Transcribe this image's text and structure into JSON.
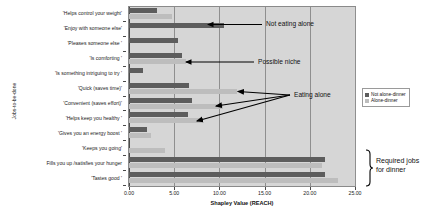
{
  "chart_data": {
    "type": "bar",
    "orientation": "horizontal",
    "title": "",
    "xlabel": "Shapley Value (REACH)",
    "ylabel": "Jobs-to-be-done",
    "xlim": [
      0.0,
      25.0
    ],
    "xticks": [
      "0.00",
      "5.00",
      "10.00",
      "15.00",
      "20.00",
      "25.00"
    ],
    "xtick_values": [
      0,
      5,
      10,
      15,
      20,
      25
    ],
    "grid": true,
    "legend_position": "right",
    "categories": [
      "'Helps control your weight'",
      "'Enjoy with someone else'",
      "'Pleases someone else '",
      "'Is comforting '",
      "'Is something intriguing to try '",
      "'Quick (saves time)'",
      "'Convenient (saves effort)'",
      "'Helps keep you healthy '",
      "'Gives you an energy boost '",
      "'Keeps you going'",
      "Fills you up /satisfies your hunger",
      "'Tastes good '"
    ],
    "series": [
      {
        "name": "Not alone-dinner",
        "color": "#5d5d5d",
        "values": [
          3.1,
          10.5,
          5.4,
          5.9,
          1.5,
          6.6,
          7.0,
          6.5,
          2.0,
          0.0,
          21.7,
          21.7
        ]
      },
      {
        "name": "Alone-dinner",
        "color": "#bdbdbd",
        "values": [
          4.8,
          0.0,
          0.0,
          6.3,
          0.0,
          12.0,
          10.4,
          8.2,
          2.4,
          4.0,
          21.4,
          23.1
        ]
      }
    ],
    "annotations": [
      {
        "text": "Not eating alone",
        "target_category": "'Enjoy with someone else'"
      },
      {
        "text": "Possible niche",
        "target_category": "'Is comforting '"
      },
      {
        "text": "Eating alone",
        "target_category": "'Quick (saves time)'"
      },
      {
        "text": "Required jobs\nfor dinner",
        "target_category": "'Tastes good '"
      }
    ],
    "bracket_label_line1": "Required jobs",
    "bracket_label_line2": "for dinner",
    "plot_background": "#d6d6d6",
    "gridline_color": "#8f8f8f"
  }
}
